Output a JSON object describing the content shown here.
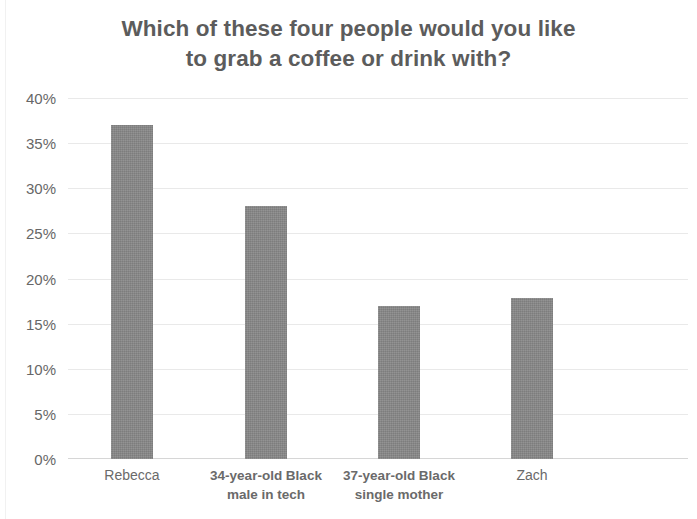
{
  "chart_data": {
    "type": "bar",
    "title": "Which of these four people would you like to grab a coffee or drink with?",
    "title_lines": [
      "Which of these four people would you like",
      "to grab a coffee or drink with?"
    ],
    "categories": [
      "Rebecca",
      "34-year-old Black male in tech",
      "37-year-old Black single mother",
      "Zach"
    ],
    "category_lines": [
      [
        "Rebecca"
      ],
      [
        "34-year-old Black",
        "male in tech"
      ],
      [
        "37-year-old Black",
        "single mother"
      ],
      [
        "Zach"
      ]
    ],
    "values": [
      37,
      28,
      17,
      17.8
    ],
    "value_labels": [
      "37%",
      "28%",
      "17%",
      "17.8%"
    ],
    "xlabel": "",
    "ylabel": "",
    "ylim": [
      0,
      40
    ],
    "ytick_values": [
      0,
      5,
      10,
      15,
      20,
      25,
      30,
      35,
      40
    ],
    "ytick_labels": [
      "0%",
      "5%",
      "10%",
      "15%",
      "20%",
      "25%",
      "30%",
      "35%",
      "40%"
    ],
    "grid": true,
    "legend": false,
    "legend_position": "none",
    "bar_color": "#878787",
    "title_color": "#5c5c5c",
    "tick_label_color": "#676767",
    "gridline_color": "#e9e9e9",
    "background_color": "#ffffff"
  }
}
